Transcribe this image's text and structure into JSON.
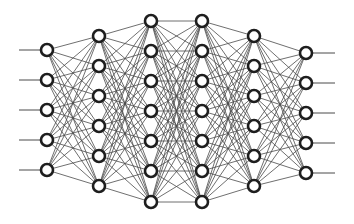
{
  "diagram": {
    "type": "fully-connected-neural-network",
    "width": 354,
    "height": 224,
    "colors": {
      "background": "#ffffff",
      "edge": "#4a4a4a",
      "node_stroke": "#1e1e1e",
      "node_fill": "#ffffff"
    },
    "node_radius": 6,
    "input_line_start_x": 19,
    "output_line_end_x": 335,
    "layers": [
      {
        "name": "input-layer",
        "x": 47,
        "nodes_y": [
          50,
          80,
          110,
          140,
          170
        ]
      },
      {
        "name": "hidden-layer-1",
        "x": 99,
        "nodes_y": [
          36,
          66,
          96,
          126,
          156,
          186
        ]
      },
      {
        "name": "hidden-layer-2",
        "x": 151,
        "nodes_y": [
          21,
          51,
          81,
          111,
          141,
          171,
          202
        ]
      },
      {
        "name": "hidden-layer-3",
        "x": 202,
        "nodes_y": [
          21,
          51,
          81,
          111,
          141,
          171,
          202
        ]
      },
      {
        "name": "hidden-layer-4",
        "x": 254,
        "nodes_y": [
          36,
          66,
          96,
          126,
          156,
          186
        ]
      },
      {
        "name": "output-layer",
        "x": 306,
        "nodes_y": [
          53,
          83,
          113,
          143,
          173
        ]
      }
    ]
  }
}
